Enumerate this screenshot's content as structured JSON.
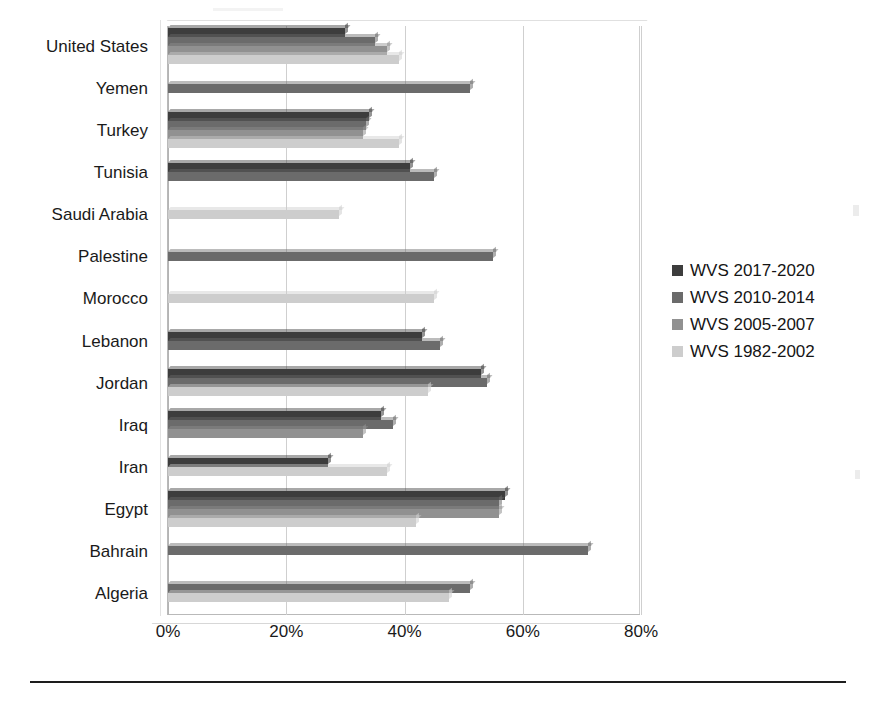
{
  "chart_data": {
    "type": "bar",
    "orientation": "horizontal",
    "title": "",
    "subtitle": "",
    "xlabel": "",
    "ylabel": "",
    "xlim": [
      0,
      80
    ],
    "xticks": [
      "0%",
      "20%",
      "40%",
      "60%",
      "80%"
    ],
    "xtick_values": [
      0,
      20,
      40,
      60,
      80
    ],
    "grid": true,
    "grid_axis": "x",
    "legend_position": "right",
    "value_unit": "%",
    "categories": [
      "United States",
      "Yemen",
      "Turkey",
      "Tunisia",
      "Saudi Arabia",
      "Palestine",
      "Morocco",
      "Lebanon",
      "Jordan",
      "Iraq",
      "Iran",
      "Egypt",
      "Bahrain",
      "Algeria"
    ],
    "series": [
      {
        "name": "WVS 2017-2020",
        "color": "#3d3d3d",
        "values": [
          30,
          null,
          34,
          41,
          null,
          null,
          null,
          43,
          53,
          36,
          27,
          57,
          null,
          null
        ]
      },
      {
        "name": "WVS 2010-2014",
        "color": "#6b6b6b",
        "values": [
          35,
          51,
          33.5,
          45,
          null,
          55,
          null,
          46,
          54,
          38,
          null,
          56,
          71,
          51
        ]
      },
      {
        "name": "WVS 2005-2007",
        "color": "#919191",
        "values": [
          37,
          null,
          33,
          null,
          null,
          null,
          null,
          null,
          null,
          33,
          null,
          56,
          null,
          null
        ]
      },
      {
        "name": "WVS 1982-2002",
        "color": "#cdcdcd",
        "values": [
          39,
          null,
          39,
          null,
          29,
          null,
          45,
          null,
          44,
          null,
          37,
          42,
          null,
          47.5
        ]
      }
    ]
  },
  "legend": {
    "items": [
      {
        "label": "WVS 2017-2020",
        "color": "#3d3d3d"
      },
      {
        "label": "WVS 2010-2014",
        "color": "#6b6b6b"
      },
      {
        "label": "WVS 2005-2007",
        "color": "#919191"
      },
      {
        "label": "WVS 1982-2002",
        "color": "#cdcdcd"
      }
    ]
  },
  "footer": {
    "note": ""
  }
}
